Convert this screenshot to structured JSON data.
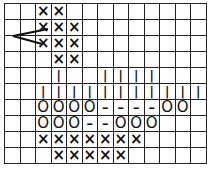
{
  "diagram": {
    "type": "stitch-chart-grid",
    "columns": 13,
    "rows": 10,
    "legend_symbols": {
      "X": "×",
      "O": "O",
      "|": "|",
      "-": "–"
    },
    "grid": [
      [
        "",
        "",
        "X",
        "X",
        "",
        "",
        "",
        "",
        "",
        "",
        "",
        "",
        ""
      ],
      [
        "",
        "",
        "X",
        "X",
        "X",
        "",
        "",
        "",
        "",
        "",
        "",
        "",
        ""
      ],
      [
        "",
        "",
        "X",
        "X",
        "X",
        "",
        "",
        "",
        "",
        "",
        "",
        "",
        ""
      ],
      [
        "",
        "",
        "",
        "X",
        "X",
        "",
        "",
        "",
        "",
        "",
        "",
        "",
        ""
      ],
      [
        "",
        "",
        "",
        "|",
        "",
        "",
        "|",
        "|",
        "|",
        "|",
        "",
        "",
        ""
      ],
      [
        "",
        "",
        "|",
        "|",
        "|",
        "|",
        "|",
        "|",
        "|",
        "|",
        "|",
        "|",
        "|"
      ],
      [
        "",
        "",
        "O",
        "O",
        "O",
        "O",
        "-",
        "-",
        "-",
        "-",
        "O",
        "O",
        ""
      ],
      [
        "",
        "",
        "O",
        "O",
        "O",
        "-",
        "-",
        "O",
        "O",
        "O",
        "",
        "",
        ""
      ],
      [
        "",
        "",
        "X",
        "X",
        "X",
        "X",
        "X",
        "X",
        "X",
        "",
        "",
        "",
        ""
      ],
      [
        "",
        "",
        "",
        "X",
        "X",
        "X",
        "X",
        "X",
        "",
        "",
        "",
        "",
        ""
      ]
    ],
    "arrow": {
      "points_to_row": 2,
      "points_to_col": 2,
      "shape": "chevron-left"
    }
  }
}
